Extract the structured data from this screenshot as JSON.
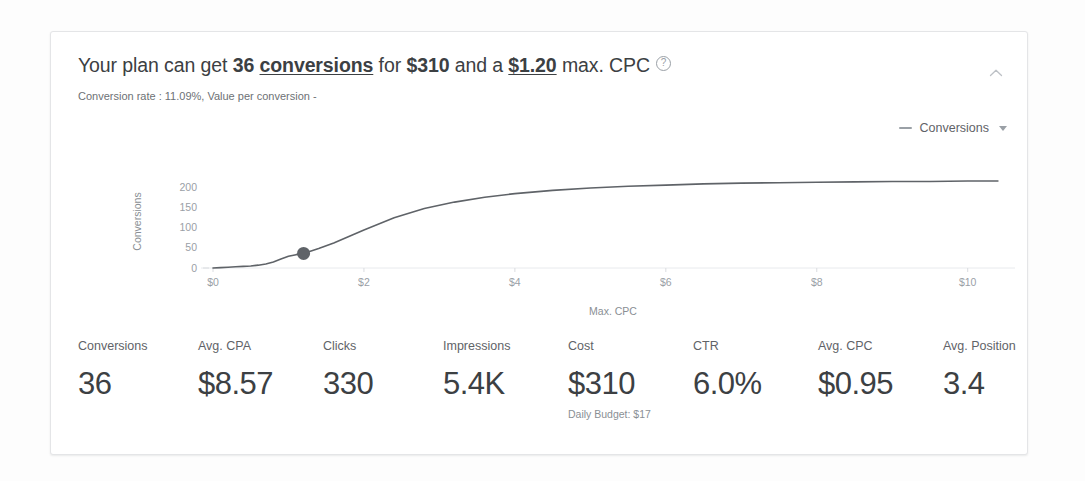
{
  "card": {
    "headline": {
      "part1": "Your plan can get ",
      "bold_conversions_count": "36",
      "space1": " ",
      "underlined_conversions": "conversions",
      "part2": " for ",
      "bold_cost": "$310",
      "part3": " and a ",
      "underlined_cpc": "$1.20",
      "part4": " max. CPC",
      "help_icon": "help-circle-icon"
    },
    "subline": "Conversion rate : 11.09%, Value per conversion -",
    "collapse_icon": "chevron-up-icon"
  },
  "legend": {
    "marker": "line-dash-marker",
    "label": "Conversions",
    "caret_icon": "chevron-down-icon"
  },
  "chart_data": {
    "type": "line",
    "title": "",
    "xlabel": "Max. CPC",
    "ylabel": "Conversions",
    "xtick_labels": [
      "$0",
      "$2",
      "$4",
      "$6",
      "$8",
      "$10"
    ],
    "xtick_values": [
      0,
      2,
      4,
      6,
      8,
      10
    ],
    "ytick_labels": [
      "0",
      "50",
      "100",
      "150",
      "200"
    ],
    "ytick_values": [
      0,
      50,
      100,
      150,
      200
    ],
    "xlim": [
      0,
      10.6
    ],
    "ylim": [
      0,
      230
    ],
    "grid": false,
    "legend_position": "top-right",
    "series": [
      {
        "name": "Conversions",
        "color": "#5f6368",
        "x": [
          0.0,
          0.1,
          0.2,
          0.3,
          0.4,
          0.5,
          0.6,
          0.7,
          0.8,
          0.9,
          1.0,
          1.1,
          1.2,
          1.4,
          1.6,
          1.8,
          2.0,
          2.4,
          2.8,
          3.2,
          3.6,
          4.0,
          4.5,
          5.0,
          5.5,
          6.0,
          6.5,
          7.0,
          7.5,
          8.0,
          8.5,
          9.0,
          9.5,
          10.0,
          10.4
        ],
        "y": [
          0,
          1,
          2,
          3,
          4,
          5,
          7,
          10,
          15,
          22,
          29,
          33,
          36,
          48,
          62,
          78,
          94,
          124,
          147,
          163,
          175,
          184,
          192,
          198,
          202,
          205,
          208,
          210,
          211,
          212,
          213,
          214,
          214,
          215,
          215
        ]
      }
    ],
    "marker_point": {
      "name": "selected-plan-point",
      "x": 1.2,
      "y": 36,
      "color": "#5f6368"
    }
  },
  "metrics": [
    {
      "label": "Conversions",
      "value": "36",
      "sub": ""
    },
    {
      "label": "Avg. CPA",
      "value": "$8.57",
      "sub": ""
    },
    {
      "label": "Clicks",
      "value": "330",
      "sub": ""
    },
    {
      "label": "Impressions",
      "value": "5.4K",
      "sub": ""
    },
    {
      "label": "Cost",
      "value": "$310",
      "sub": "Daily Budget: $17"
    },
    {
      "label": "CTR",
      "value": "6.0%",
      "sub": ""
    },
    {
      "label": "Avg. CPC",
      "value": "$0.95",
      "sub": ""
    },
    {
      "label": "Avg. Position",
      "value": "3.4",
      "sub": ""
    }
  ],
  "colors": {
    "card_background": "#ffffff",
    "page_background": "#fdfdfd",
    "border": "#e4e5e7",
    "text_primary": "#3c4043",
    "text_secondary": "#5f6368",
    "text_muted": "#9aa0a6",
    "line": "#5f6368"
  }
}
